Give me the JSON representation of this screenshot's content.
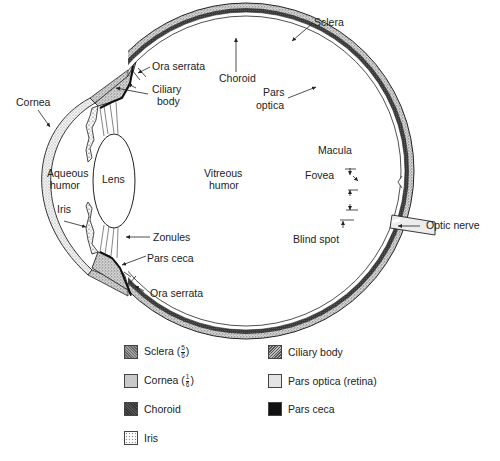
{
  "diagram": {
    "labels": {
      "sclera": "Sclera",
      "choroid": "Choroid",
      "pars_optica_1": "Pars",
      "pars_optica_2": "optica",
      "ora_serrata_top": "Ora serrata",
      "ciliary_body_1": "Ciliary",
      "ciliary_body_2": "body",
      "cornea": "Cornea",
      "aqueous_1": "Aqueous",
      "aqueous_2": "humor",
      "lens": "Lens",
      "vitreous_1": "Vitreous",
      "vitreous_2": "humor",
      "iris": "Iris",
      "zonules": "Zonules",
      "pars_ceca": "Pars ceca",
      "ora_serrata_bottom": "Ora serrata",
      "macula": "Macula",
      "fovea": "Fovea",
      "blind_spot": "Blind spot",
      "optic_nerve": "Optic nerve"
    }
  },
  "legend": {
    "items": [
      {
        "id": "sclera",
        "label": "Sclera (",
        "fraction": {
          "num": "5",
          "den": "6"
        },
        "suffix": ")"
      },
      {
        "id": "cornea",
        "label": "Cornea (",
        "fraction": {
          "num": "1",
          "den": "6"
        },
        "suffix": ")"
      },
      {
        "id": "choroid",
        "label": "Choroid"
      },
      {
        "id": "iris",
        "label": "Iris"
      },
      {
        "id": "ciliary",
        "label": "Ciliary body"
      },
      {
        "id": "parsoptica",
        "label": "Pars optica (retina)"
      },
      {
        "id": "parsceca",
        "label": "Pars ceca"
      }
    ]
  },
  "colors": {
    "ink": "#222222",
    "choroid": "#3a3a3a",
    "pars_ceca": "#111111",
    "pars_optica": "#e4e4e4",
    "background": "#ffffff"
  }
}
